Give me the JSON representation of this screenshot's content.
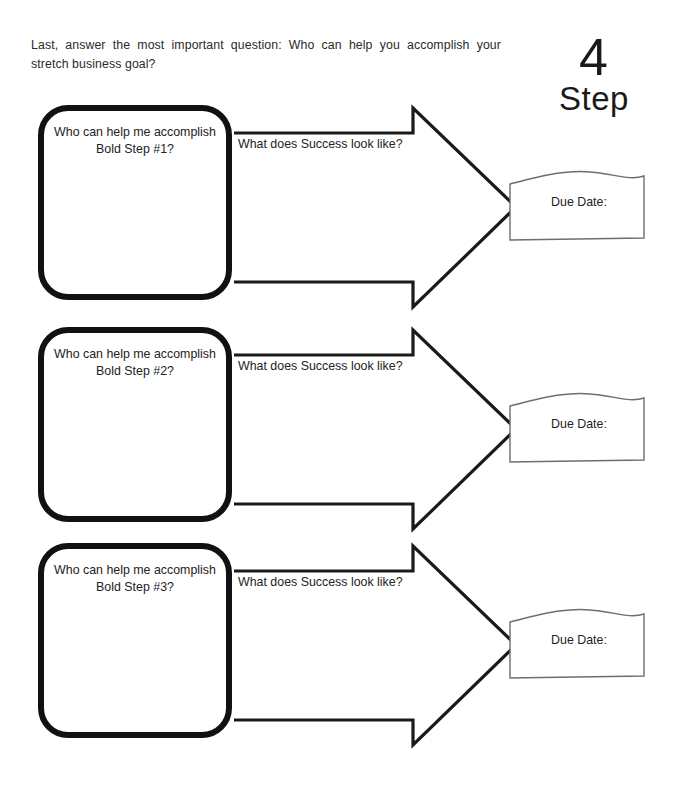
{
  "intro": {
    "text": "Last, answer the most important question: Who can help you accomplish your stretch business goal?"
  },
  "heading": {
    "number": "4",
    "word": "Step"
  },
  "rows": [
    {
      "who_label": "Who can help me accomplish Bold Step #1?",
      "success_label": "What does Success look like?",
      "due_label": "Due Date:"
    },
    {
      "who_label": "Who can help me accomplish Bold Step #2?",
      "success_label": "What does Success look like?",
      "due_label": "Due Date:"
    },
    {
      "who_label": "Who can help me accomplish Bold Step #3?",
      "success_label": "What does Success look like?",
      "due_label": "Due Date:"
    }
  ],
  "colors": {
    "page_background": "#ffffff",
    "box_border": "#111111",
    "arrow_stroke": "#1a1a1a",
    "due_box_stroke": "#6e6e6e",
    "text": "#232323"
  }
}
